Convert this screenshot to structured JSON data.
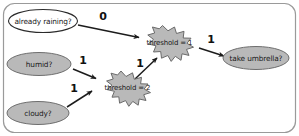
{
  "figure": {
    "frame": {
      "name": "diagram-frame",
      "border_color": "#9a9a9a"
    },
    "palette": {
      "node_gray_fill": "#b9b9b9",
      "node_white_fill": "#ffffff",
      "node_stroke": "#6e6e6e",
      "edge_color": "#1c1c1c",
      "text_color": "#1a1a1a",
      "background": "#ffffff"
    }
  },
  "nodes": [
    {
      "id": "already-raining",
      "label": "already raining?",
      "shape": "ellipse",
      "fill": "#ffffff"
    },
    {
      "id": "humid",
      "label": "humid?",
      "shape": "ellipse",
      "fill": "#b9b9b9"
    },
    {
      "id": "cloudy",
      "label": "cloudy?",
      "shape": "ellipse",
      "fill": "#b9b9b9"
    },
    {
      "id": "threshold-1",
      "label": "threshold = 1",
      "shape": "burst",
      "fill": "#b9b9b9"
    },
    {
      "id": "threshold-2",
      "label": "threshold = 2",
      "shape": "burst",
      "fill": "#b9b9b9"
    },
    {
      "id": "take-umbrella",
      "label": "take umbrella?",
      "shape": "ellipse",
      "fill": "#b9b9b9"
    }
  ],
  "edges": [
    {
      "id": "edge-already-raining-to-threshold-1",
      "from": "already-raining",
      "to": "threshold-1",
      "weight": "0"
    },
    {
      "id": "edge-humid-to-threshold-2",
      "from": "humid",
      "to": "threshold-2",
      "weight": "1"
    },
    {
      "id": "edge-cloudy-to-threshold-2",
      "from": "cloudy",
      "to": "threshold-2",
      "weight": "1"
    },
    {
      "id": "edge-threshold-2-to-threshold-1",
      "from": "threshold-2",
      "to": "threshold-1",
      "weight": "1"
    },
    {
      "id": "edge-threshold-1-to-take-umbrella",
      "from": "threshold-1",
      "to": "take-umbrella",
      "weight": "1"
    }
  ]
}
